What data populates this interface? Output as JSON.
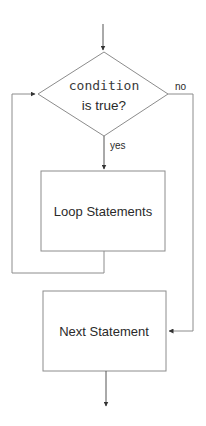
{
  "diagram": {
    "type": "flowchart-while-loop",
    "colors": {
      "line": "#8c8c8c",
      "text": "#2a2a2a",
      "background": "#ffffff"
    },
    "nodes": {
      "condition": {
        "line1": "condition",
        "line2": "is true?"
      },
      "loop_body": {
        "label": "Loop Statements"
      },
      "next": {
        "label": "Next Statement"
      }
    },
    "edges": {
      "yes_label": "yes",
      "no_label": "no"
    }
  }
}
